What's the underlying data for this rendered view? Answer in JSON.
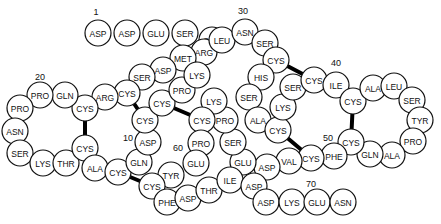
{
  "diagram": {
    "title": "",
    "residue_radius": 13,
    "residues": [
      {
        "label": "ASP",
        "x": 98,
        "y": 33
      },
      {
        "label": "ASP",
        "x": 127,
        "y": 33
      },
      {
        "label": "GLU",
        "x": 156,
        "y": 33
      },
      {
        "label": "SER",
        "x": 185,
        "y": 33
      },
      {
        "label": "SER",
        "x": 212,
        "y": 40
      },
      {
        "label": "ARG",
        "x": 204,
        "y": 52
      },
      {
        "label": "MET",
        "x": 183,
        "y": 58
      },
      {
        "label": "ASP",
        "x": 163,
        "y": 70
      },
      {
        "label": "SER",
        "x": 142,
        "y": 77
      },
      {
        "label": "CYS",
        "x": 127,
        "y": 93
      },
      {
        "label": "ARG",
        "x": 105,
        "y": 97
      },
      {
        "label": "CYS",
        "x": 85,
        "y": 108
      },
      {
        "label": "GLN",
        "x": 65,
        "y": 95
      },
      {
        "label": "PRO",
        "x": 40,
        "y": 95
      },
      {
        "label": "PRO",
        "x": 20,
        "y": 108
      },
      {
        "label": "ASN",
        "x": 15,
        "y": 131
      },
      {
        "label": "SER",
        "x": 20,
        "y": 153
      },
      {
        "label": "LYS",
        "x": 43,
        "y": 163
      },
      {
        "label": "THR",
        "x": 66,
        "y": 163
      },
      {
        "label": "CYS",
        "x": 85,
        "y": 148
      },
      {
        "label": "ALA",
        "x": 95,
        "y": 168
      },
      {
        "label": "CYS",
        "x": 118,
        "y": 172
      },
      {
        "label": "GLN",
        "x": 139,
        "y": 162
      },
      {
        "label": "ASP",
        "x": 148,
        "y": 142
      },
      {
        "label": "CYS",
        "x": 145,
        "y": 120
      },
      {
        "label": "CYS",
        "x": 162,
        "y": 103
      },
      {
        "label": "PRO",
        "x": 182,
        "y": 90
      },
      {
        "label": "LYS",
        "x": 197,
        "y": 75
      },
      {
        "label": "LEU",
        "x": 222,
        "y": 40
      },
      {
        "label": "ASN",
        "x": 245,
        "y": 32
      },
      {
        "label": "SER",
        "x": 265,
        "y": 43
      },
      {
        "label": "CYS",
        "x": 276,
        "y": 60
      },
      {
        "label": "HIS",
        "x": 261,
        "y": 77
      },
      {
        "label": "SER",
        "x": 249,
        "y": 97
      },
      {
        "label": "ALA",
        "x": 258,
        "y": 120
      },
      {
        "label": "CYS",
        "x": 278,
        "y": 130
      },
      {
        "label": "LYS",
        "x": 283,
        "y": 107
      },
      {
        "label": "SER",
        "x": 293,
        "y": 87
      },
      {
        "label": "CYS",
        "x": 314,
        "y": 80
      },
      {
        "label": "ILE",
        "x": 336,
        "y": 85
      },
      {
        "label": "CYS",
        "x": 353,
        "y": 101
      },
      {
        "label": "ALA",
        "x": 373,
        "y": 88
      },
      {
        "label": "LEU",
        "x": 394,
        "y": 86
      },
      {
        "label": "SER",
        "x": 412,
        "y": 100
      },
      {
        "label": "TYR",
        "x": 420,
        "y": 120
      },
      {
        "label": "PRO",
        "x": 413,
        "y": 141
      },
      {
        "label": "ALA",
        "x": 392,
        "y": 155
      },
      {
        "label": "GLN",
        "x": 370,
        "y": 154
      },
      {
        "label": "CYS",
        "x": 351,
        "y": 142
      },
      {
        "label": "PHE",
        "x": 334,
        "y": 156
      },
      {
        "label": "CYS",
        "x": 311,
        "y": 158
      },
      {
        "label": "VAL",
        "x": 289,
        "y": 161
      },
      {
        "label": "ASP",
        "x": 267,
        "y": 167
      },
      {
        "label": "GLU",
        "x": 243,
        "y": 162
      },
      {
        "label": "SER",
        "x": 233,
        "y": 142
      },
      {
        "label": "PRO",
        "x": 225,
        "y": 120
      },
      {
        "label": "LYS",
        "x": 214,
        "y": 101
      },
      {
        "label": "CYS",
        "x": 202,
        "y": 120
      },
      {
        "label": "PRO",
        "x": 201,
        "y": 143
      },
      {
        "label": "GLU",
        "x": 196,
        "y": 163
      },
      {
        "label": "TYR",
        "x": 171,
        "y": 175
      },
      {
        "label": "CYS",
        "x": 152,
        "y": 186
      },
      {
        "label": "PHE",
        "x": 167,
        "y": 202
      },
      {
        "label": "ASP",
        "x": 188,
        "y": 198
      },
      {
        "label": "THR",
        "x": 209,
        "y": 190
      },
      {
        "label": "ILE",
        "x": 230,
        "y": 180
      },
      {
        "label": "ASP",
        "x": 254,
        "y": 186
      },
      {
        "label": "ASP",
        "x": 266,
        "y": 202
      },
      {
        "label": "LYS",
        "x": 292,
        "y": 202
      },
      {
        "label": "GLU",
        "x": 317,
        "y": 202
      },
      {
        "label": "ASN",
        "x": 343,
        "y": 202
      }
    ],
    "position_labels": [
      {
        "text": "1",
        "x": 96,
        "y": 15
      },
      {
        "text": "10",
        "x": 128,
        "y": 141
      },
      {
        "text": "20",
        "x": 40,
        "y": 80
      },
      {
        "text": "30",
        "x": 243,
        "y": 14
      },
      {
        "text": "40",
        "x": 336,
        "y": 66
      },
      {
        "text": "50",
        "x": 328,
        "y": 141
      },
      {
        "text": "60",
        "x": 178,
        "y": 151
      },
      {
        "text": "70",
        "x": 311,
        "y": 187
      }
    ],
    "disulfide_bonds": [
      {
        "x1": 85,
        "y1": 108,
        "x2": 85,
        "y2": 148
      },
      {
        "x1": 127,
        "y1": 93,
        "x2": 145,
        "y2": 120
      },
      {
        "x1": 162,
        "y1": 103,
        "x2": 202,
        "y2": 120
      },
      {
        "x1": 276,
        "y1": 60,
        "x2": 314,
        "y2": 80
      },
      {
        "x1": 278,
        "y1": 130,
        "x2": 311,
        "y2": 158
      },
      {
        "x1": 353,
        "y1": 101,
        "x2": 351,
        "y2": 142
      },
      {
        "x1": 118,
        "y1": 172,
        "x2": 152,
        "y2": 186
      }
    ]
  }
}
